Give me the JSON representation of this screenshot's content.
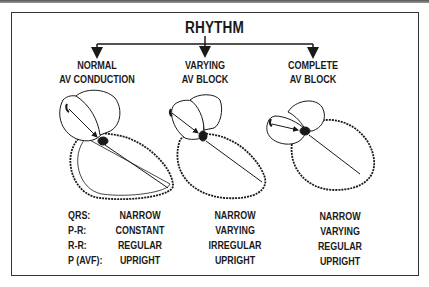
{
  "diagram": {
    "title": "RHYTHM",
    "columns": [
      {
        "heading_line1": "NORMAL",
        "heading_line2": "AV CONDUCTION",
        "icon": "heart-normal-conduction-illustration"
      },
      {
        "heading_line1": "VARYING",
        "heading_line2": "AV BLOCK",
        "icon": "heart-varying-av-block-illustration"
      },
      {
        "heading_line1": "COMPLETE",
        "heading_line2": "AV BLOCK",
        "icon": "heart-complete-av-block-illustration"
      }
    ],
    "row_labels": [
      "QRS:",
      "P-R:",
      "R-R:",
      "P (AVF):"
    ],
    "values": [
      [
        "NARROW",
        "CONSTANT",
        "REGULAR",
        "UPRIGHT"
      ],
      [
        "NARROW",
        "VARYING",
        "IRREGULAR",
        "UPRIGHT"
      ],
      [
        "NARROW",
        "VARYING",
        "REGULAR",
        "UPRIGHT"
      ]
    ]
  }
}
